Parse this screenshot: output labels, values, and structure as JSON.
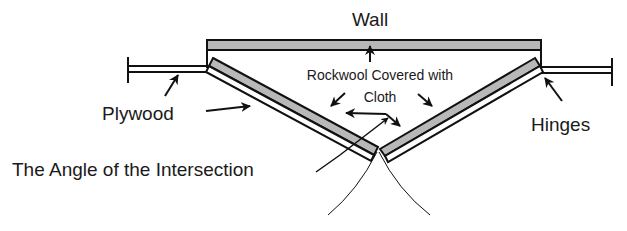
{
  "diagram": {
    "labels": {
      "wall": "Wall",
      "rockwool_line1": "Rockwool Covered with",
      "rockwool_line2": "Cloth",
      "plywood": "Plywood",
      "hinges": "Hinges",
      "angle": "The Angle of the Intersection"
    },
    "colors": {
      "stroke": "#111111",
      "rockwool_fill": "#b8b8b8",
      "background": "#ffffff"
    }
  }
}
